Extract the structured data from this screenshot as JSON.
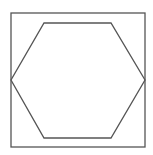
{
  "diagram": {
    "title": "",
    "stroke_color": "#555555",
    "background": "#ffffff",
    "shapes": [
      {
        "type": "square",
        "x": 11,
        "y": 13,
        "width": 134,
        "height": 134
      },
      {
        "type": "hexagon",
        "points": "44,23 111,23 145,80 111,138 44,138 11,80"
      }
    ]
  }
}
